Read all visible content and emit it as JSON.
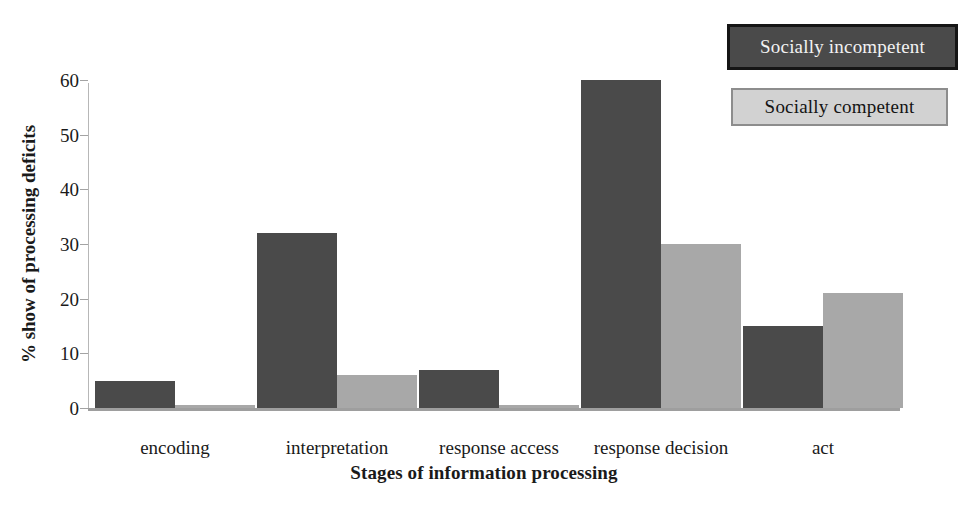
{
  "chart_data": {
    "type": "bar",
    "title": "",
    "xlabel": "Stages of information processing",
    "ylabel": "% show of processing deficits",
    "categories": [
      "encoding",
      "interpretation",
      "response access",
      "response decision",
      "act"
    ],
    "series": [
      {
        "name": "Socially incompetent",
        "color": "#4a4a4a",
        "values": [
          5,
          32,
          7,
          60,
          15
        ]
      },
      {
        "name": "Socially competent",
        "color": "#a8a8a8",
        "values": [
          0.5,
          6,
          0.5,
          30,
          21
        ]
      }
    ],
    "ylim": [
      0,
      60
    ],
    "yticks": [
      0,
      10,
      20,
      30,
      40,
      50,
      60
    ],
    "ytick_labels": [
      "0",
      "10",
      "20",
      "30",
      "40",
      "50",
      "60"
    ],
    "grid": false,
    "legend_position": "top-right"
  },
  "legend": {
    "incompetent": {
      "label": "Socially incompetent",
      "fill": "#4a4a4a",
      "border": "#151515",
      "text_color": "#f2f2f2"
    },
    "competent": {
      "label": "Socially competent",
      "fill": "#d2d2d2",
      "border": "#8d8d8d",
      "text_color": "#141414"
    }
  },
  "axes": {
    "y_title": "% show of processing deficits",
    "x_title": "Stages of information processing"
  }
}
